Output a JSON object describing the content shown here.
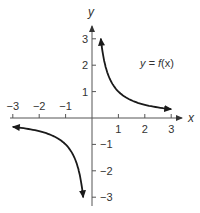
{
  "chart_data": {
    "type": "line",
    "title": "",
    "xlabel": "x",
    "ylabel": "y",
    "xlim": [
      -3,
      3
    ],
    "ylim": [
      -3,
      3
    ],
    "grid": false,
    "x_ticks": [
      -3,
      -2,
      -1,
      1,
      2,
      3
    ],
    "y_ticks": [
      -3,
      -2,
      -1,
      1,
      2,
      3
    ],
    "x_tick_labels": [
      "−3",
      "−2",
      "−1",
      "1",
      "2",
      "3"
    ],
    "y_tick_labels": [
      "−3",
      "−2",
      "−1",
      "1",
      "2",
      "3"
    ],
    "annotation": "y = f(x)",
    "function": "f(x) = 1/x",
    "series": [
      {
        "name": "f(x), x > 0",
        "x": [
          0.333,
          0.4,
          0.5,
          0.6,
          0.75,
          1,
          1.25,
          1.5,
          2,
          2.5,
          3
        ],
        "y": [
          3,
          2.5,
          2,
          1.667,
          1.333,
          1,
          0.8,
          0.667,
          0.5,
          0.4,
          0.333
        ],
        "arrows": [
          "up",
          "right"
        ]
      },
      {
        "name": "f(x), x < 0",
        "x": [
          -3,
          -2.5,
          -2,
          -1.5,
          -1.25,
          -1,
          -0.75,
          -0.6,
          -0.5,
          -0.4,
          -0.333
        ],
        "y": [
          -0.333,
          -0.4,
          -0.5,
          -0.667,
          -0.8,
          -1,
          -1.333,
          -1.667,
          -2,
          -2.5,
          -3
        ],
        "arrows": [
          "left",
          "down"
        ]
      }
    ]
  },
  "labels": {
    "x_axis": "x",
    "y_axis": "y",
    "function_prefix": "y = ",
    "function_name": "f",
    "function_arg": "(x)"
  },
  "colors": {
    "axis": "#555555",
    "curve": "#1a1a1a",
    "text": "#333333"
  }
}
